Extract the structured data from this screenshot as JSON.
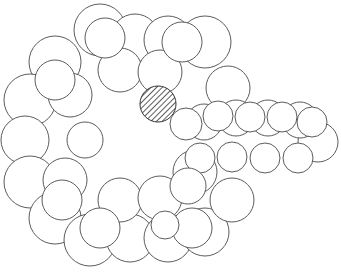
{
  "diagram": {
    "type": "space-filling molecular model (line art)",
    "caption": "",
    "colors": {
      "stroke": "#4a4a4a",
      "fill": "#ffffff",
      "hatch": "#333333"
    },
    "highlight": {
      "label": "hatched atom",
      "cx": 158,
      "cy": 104,
      "r": 18
    },
    "ring_back": [
      {
        "cx": 100,
        "cy": 30,
        "r": 26
      },
      {
        "cx": 135,
        "cy": 38,
        "r": 24
      },
      {
        "cx": 168,
        "cy": 40,
        "r": 24
      },
      {
        "cx": 205,
        "cy": 42,
        "r": 26
      },
      {
        "cx": 55,
        "cy": 62,
        "r": 26
      },
      {
        "cx": 30,
        "cy": 100,
        "r": 26
      },
      {
        "cx": 25,
        "cy": 140,
        "r": 24
      },
      {
        "cx": 30,
        "cy": 182,
        "r": 26
      },
      {
        "cx": 55,
        "cy": 218,
        "r": 26
      },
      {
        "cx": 90,
        "cy": 240,
        "r": 26
      },
      {
        "cx": 130,
        "cy": 238,
        "r": 24
      },
      {
        "cx": 168,
        "cy": 238,
        "r": 24
      },
      {
        "cx": 205,
        "cy": 232,
        "r": 24
      },
      {
        "cx": 232,
        "cy": 200,
        "r": 22
      },
      {
        "cx": 228,
        "cy": 88,
        "r": 22
      },
      {
        "cx": 70,
        "cy": 95,
        "r": 22
      },
      {
        "cx": 65,
        "cy": 180,
        "r": 22
      },
      {
        "cx": 120,
        "cy": 70,
        "r": 22
      },
      {
        "cx": 160,
        "cy": 72,
        "r": 22
      },
      {
        "cx": 120,
        "cy": 200,
        "r": 22
      },
      {
        "cx": 160,
        "cy": 198,
        "r": 22
      },
      {
        "cx": 195,
        "cy": 172,
        "r": 22
      },
      {
        "cx": 85,
        "cy": 140,
        "r": 18
      }
    ],
    "ring_front": [
      {
        "cx": 105,
        "cy": 38,
        "r": 20
      },
      {
        "cx": 182,
        "cy": 42,
        "r": 20
      },
      {
        "cx": 55,
        "cy": 80,
        "r": 20
      },
      {
        "cx": 62,
        "cy": 200,
        "r": 20
      },
      {
        "cx": 100,
        "cy": 228,
        "r": 20
      },
      {
        "cx": 192,
        "cy": 228,
        "r": 20
      },
      {
        "cx": 165,
        "cy": 225,
        "r": 14
      }
    ],
    "chain_back": [
      {
        "cx": 318,
        "cy": 142,
        "r": 20
      },
      {
        "cx": 300,
        "cy": 120,
        "r": 18
      },
      {
        "cx": 268,
        "cy": 118,
        "r": 18
      },
      {
        "cx": 236,
        "cy": 118,
        "r": 18
      },
      {
        "cx": 204,
        "cy": 122,
        "r": 18
      }
    ],
    "chain_front": [
      {
        "cx": 186,
        "cy": 124,
        "r": 16
      },
      {
        "cx": 218,
        "cy": 116,
        "r": 15
      },
      {
        "cx": 250,
        "cy": 117,
        "r": 15
      },
      {
        "cx": 282,
        "cy": 117,
        "r": 15
      },
      {
        "cx": 312,
        "cy": 122,
        "r": 15
      },
      {
        "cx": 200,
        "cy": 158,
        "r": 15
      },
      {
        "cx": 232,
        "cy": 157,
        "r": 15
      },
      {
        "cx": 265,
        "cy": 158,
        "r": 15
      },
      {
        "cx": 298,
        "cy": 158,
        "r": 15
      },
      {
        "cx": 188,
        "cy": 186,
        "r": 18
      }
    ]
  }
}
